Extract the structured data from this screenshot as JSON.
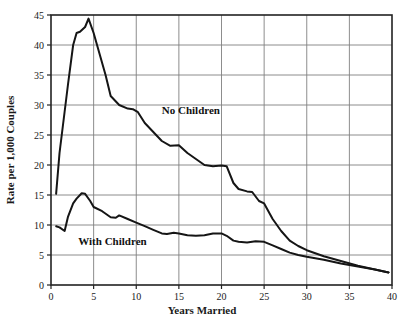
{
  "chart_data": {
    "type": "line",
    "title": "",
    "xlabel": "Years Married",
    "ylabel": "Rate per 1,000 Couples",
    "xlim": [
      0,
      40
    ],
    "ylim": [
      0,
      45
    ],
    "xticks": [
      0,
      5,
      10,
      15,
      20,
      25,
      30,
      35,
      40
    ],
    "yticks": [
      0,
      5,
      10,
      15,
      20,
      25,
      30,
      35,
      40,
      45
    ],
    "xtick_labels": [
      "0",
      "5",
      "10",
      "15",
      "20",
      "25",
      "30",
      "35",
      "40"
    ],
    "ytick_labels": [
      "0",
      "5",
      "10",
      "15",
      "20",
      "25",
      "30",
      "35",
      "40",
      "45"
    ],
    "grid": true,
    "legend_position": "inline-annotation",
    "line_color": "#151515",
    "grid_color": "#808080",
    "frame_color": "#222222",
    "background": "#ffffff",
    "series": [
      {
        "name": "No Children",
        "label_x": 13.0,
        "label_y": 28.5,
        "x": [
          0.6,
          1,
          2,
          2.6,
          3,
          3.4,
          4,
          4.4,
          5,
          5.6,
          6.4,
          7,
          8,
          9,
          9.6,
          10.2,
          11,
          12,
          13,
          14,
          15,
          16,
          17,
          18,
          19,
          20,
          20.6,
          21.4,
          22,
          23,
          23.6,
          24.4,
          25,
          26,
          27,
          28,
          29,
          30,
          32,
          34,
          36,
          38,
          39.6
        ],
        "y": [
          15.2,
          22.0,
          33.5,
          40.0,
          42.0,
          42.2,
          43.0,
          44.4,
          42.0,
          39.0,
          35.0,
          31.5,
          30.0,
          29.4,
          29.3,
          28.8,
          27.0,
          25.5,
          24.0,
          23.2,
          23.3,
          22.0,
          21.0,
          20.0,
          19.8,
          19.9,
          19.8,
          17.0,
          16.0,
          15.6,
          15.5,
          14.0,
          13.6,
          11.0,
          9.0,
          7.4,
          6.5,
          5.8,
          4.8,
          4.0,
          3.2,
          2.6,
          2.1
        ]
      },
      {
        "name": "With Children",
        "label_x": 3.2,
        "label_y": 6.6,
        "x": [
          0.6,
          1,
          1.6,
          2,
          2.6,
          3,
          3.6,
          4,
          4.6,
          5,
          6,
          7,
          7.6,
          8,
          9,
          10,
          11,
          12,
          13,
          13.6,
          14.4,
          15,
          16,
          17,
          18,
          19,
          20,
          20.6,
          21.4,
          22,
          23,
          24,
          25,
          26,
          27,
          28,
          29,
          30,
          32,
          34,
          36,
          38,
          39.6
        ],
        "y": [
          9.8,
          9.6,
          9.0,
          11.4,
          13.6,
          14.4,
          15.3,
          15.2,
          14.0,
          13.0,
          12.3,
          11.3,
          11.2,
          11.6,
          11.0,
          10.4,
          9.8,
          9.2,
          8.6,
          8.5,
          8.7,
          8.6,
          8.3,
          8.2,
          8.3,
          8.6,
          8.6,
          8.2,
          7.4,
          7.2,
          7.1,
          7.3,
          7.2,
          6.6,
          6.0,
          5.4,
          5.0,
          4.7,
          4.2,
          3.6,
          3.1,
          2.6,
          2.1
        ]
      }
    ]
  }
}
